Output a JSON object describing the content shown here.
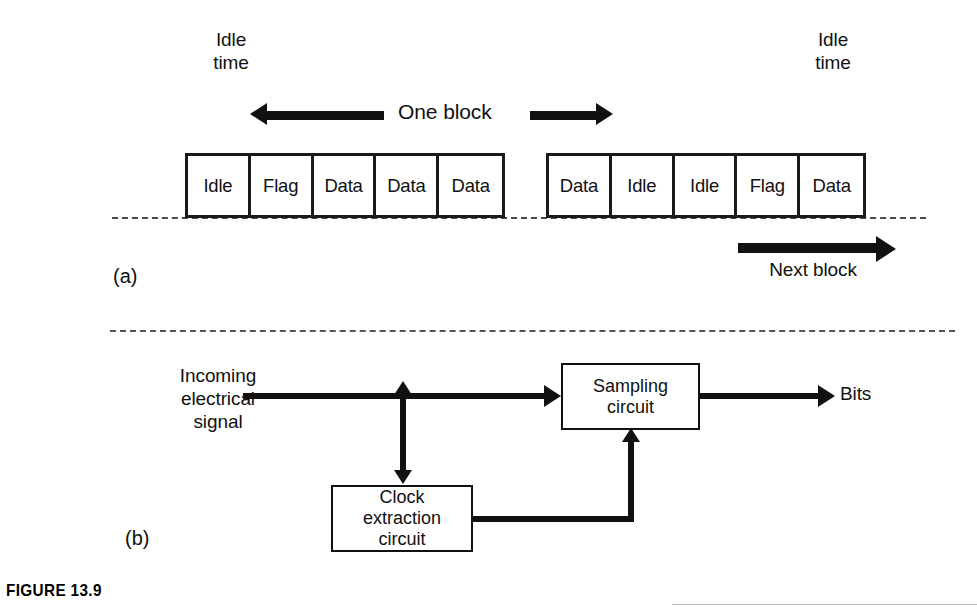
{
  "figure": {
    "caption": "FIGURE 13.9",
    "part_a_label": "(a)",
    "part_b_label": "(b)"
  },
  "part_a": {
    "idle_time_left_label": "Idle\ntime",
    "idle_time_right_label": "Idle\ntime",
    "one_block_label": "One block",
    "next_block_label": "Next block",
    "left_group": {
      "cells": [
        {
          "label": "Idle"
        },
        {
          "label": "Flag"
        },
        {
          "label": "Data"
        },
        {
          "label": "Data"
        },
        {
          "label": "Data"
        }
      ]
    },
    "right_group": {
      "cells": [
        {
          "label": "Data"
        },
        {
          "label": "Idle"
        },
        {
          "label": "Idle"
        },
        {
          "label": "Flag"
        },
        {
          "label": "Data"
        }
      ]
    }
  },
  "part_b": {
    "input_label": "Incoming\nelectrical\nsignal",
    "output_label": "Bits",
    "sampling_box_label": "Sampling\ncircuit",
    "clock_box_label": "Clock\nextraction\ncircuit"
  },
  "colors": {
    "ink": "#111111",
    "dashed": "#4a4a4a",
    "paper": "#ffffff"
  }
}
